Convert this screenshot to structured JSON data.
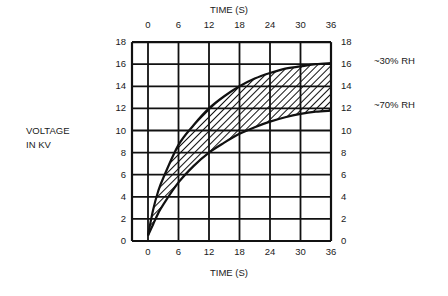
{
  "chart_data": {
    "type": "area",
    "title": "",
    "xlabel_top": "TIME (S)",
    "xlabel_bottom": "TIME (S)",
    "ylabel": [
      "VOLTAGE",
      "IN KV"
    ],
    "x_ticks": [
      0,
      6,
      12,
      18,
      24,
      30,
      36
    ],
    "y_ticks": [
      0,
      2,
      4,
      6,
      8,
      10,
      12,
      14,
      16,
      18
    ],
    "xlim": [
      -3,
      36
    ],
    "ylim": [
      0,
      18
    ],
    "grid": true,
    "band_fill": "hatched",
    "series": [
      {
        "name": "~30% RH",
        "x": [
          0,
          1,
          2,
          3,
          6,
          9,
          12,
          15,
          18,
          21,
          24,
          27,
          30,
          33,
          36
        ],
        "values": [
          0.5,
          2.8,
          4.5,
          5.7,
          8.7,
          10.5,
          12.0,
          13.1,
          14.0,
          14.7,
          15.2,
          15.6,
          15.8,
          16.0,
          16.1
        ]
      },
      {
        "name": "~70% RH",
        "x": [
          0,
          1,
          2,
          3,
          6,
          9,
          12,
          15,
          18,
          21,
          24,
          27,
          30,
          33,
          36
        ],
        "values": [
          0.5,
          1.5,
          2.5,
          3.3,
          5.3,
          6.8,
          8.0,
          8.9,
          9.7,
          10.3,
          10.8,
          11.2,
          11.5,
          11.7,
          11.8
        ]
      }
    ],
    "legend_annotations": [
      {
        "text": "~30% RH",
        "y": 16
      },
      {
        "text": "~70% RH",
        "y": 12
      }
    ]
  },
  "labels": {
    "time_top": "TIME (S)",
    "time_bottom": "TIME (S)",
    "ylabel_line1": "VOLTAGE",
    "ylabel_line2": "IN KV",
    "rh30": "~30% RH",
    "rh70": "~70% RH"
  }
}
